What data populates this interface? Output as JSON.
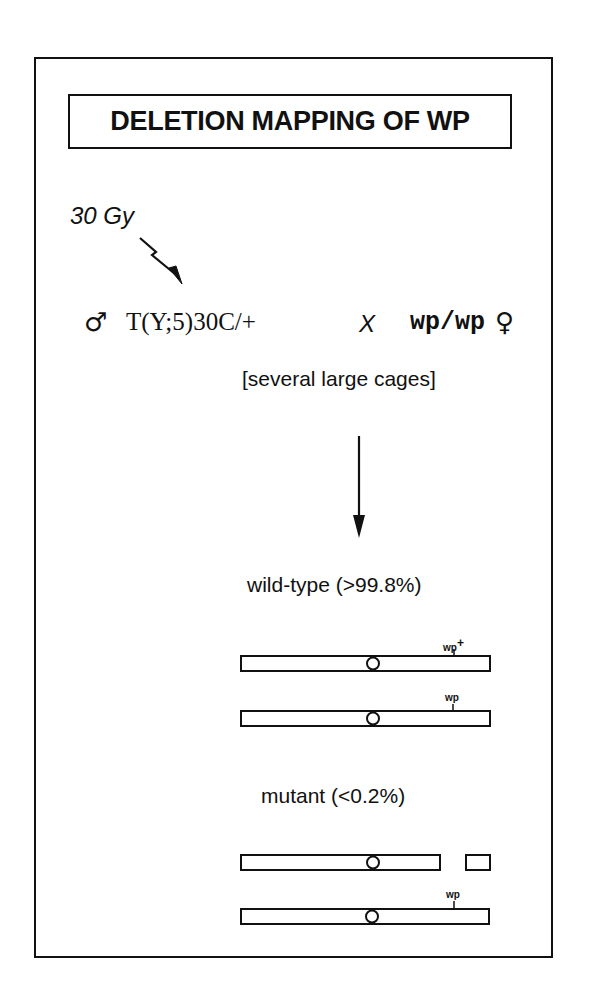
{
  "title": "DELETION MAPPING OF WP",
  "treatment": {
    "dose": "30 Gy",
    "icon": "lightning-arrow-icon"
  },
  "cross": {
    "male_symbol": "♂",
    "male_genotype": "T(Y;5)30C/+",
    "cross_symbol": "X",
    "female_genotype": "wp/wp",
    "female_symbol": "♀"
  },
  "cages_note": "[several large cages]",
  "outcomes": {
    "wild_type": {
      "label": "wild-type (>99.8%)",
      "chromosomes": [
        {
          "marker": "wp",
          "superscript": "+"
        },
        {
          "marker": "wp",
          "superscript": ""
        }
      ]
    },
    "mutant": {
      "label": "mutant (<0.2%)",
      "chromosomes": [
        {
          "marker": "",
          "note": "deletion break"
        },
        {
          "marker": "wp",
          "superscript": ""
        }
      ]
    }
  }
}
